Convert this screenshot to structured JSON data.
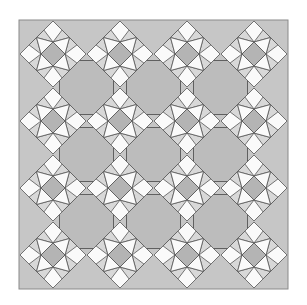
{
  "quilt": {
    "title": "Star and octagon quilt pattern",
    "origin": [
      19,
      20
    ],
    "size": 269,
    "pitch": 67,
    "star_grid": 4,
    "octagon_grid": 3,
    "star_radius": 33,
    "center_radius": 12,
    "octagon_half": 27,
    "colors": {
      "background": "#c6c6c6",
      "octagon": "#bcbcbc",
      "star_center": "#b4b4b4",
      "star_point": "#d8d8d8",
      "star_white": "#fafafa",
      "black": "#111111",
      "line": "#555555",
      "border": "#8a8a8a"
    }
  }
}
